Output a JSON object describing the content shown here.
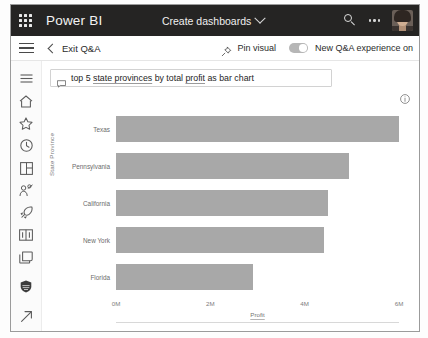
{
  "topbar": {
    "waffle_icon": "app-launcher-icon",
    "brand": "Power BI",
    "title": "Create dashboards",
    "chevron_icon": "chevron-down-icon",
    "search_icon": "search-icon",
    "more_icon": "more-horizontal-icon",
    "avatar_icon": "user-avatar"
  },
  "toolbar": {
    "menu_icon": "hamburger-menu-icon",
    "back_icon": "chevron-left-icon",
    "exit_label": "Exit Q&A",
    "pin_icon": "pin-icon",
    "pin_label": "Pin visual",
    "toggle_state": "on",
    "toggle_label": "New Q&A experience on"
  },
  "sidebar": {
    "items": [
      {
        "name": "sidebar-item-menu",
        "icon": "hamburger-menu-icon"
      },
      {
        "name": "sidebar-item-home",
        "icon": "home-icon"
      },
      {
        "name": "sidebar-item-favorites",
        "icon": "star-icon"
      },
      {
        "name": "sidebar-item-recent",
        "icon": "clock-icon"
      },
      {
        "name": "sidebar-item-apps",
        "icon": "apps-grid-icon"
      },
      {
        "name": "sidebar-item-shared",
        "icon": "shared-with-me-icon"
      },
      {
        "name": "sidebar-item-goals",
        "icon": "rocket-icon"
      },
      {
        "name": "sidebar-item-learn",
        "icon": "book-icon"
      },
      {
        "name": "sidebar-item-workspaces",
        "icon": "workspaces-icon"
      },
      {
        "name": "sidebar-item-deployment",
        "icon": "database-icon"
      },
      {
        "name": "sidebar-item-expand",
        "icon": "arrow-up-right-icon"
      }
    ]
  },
  "query": {
    "icon": "chat-bubble-icon",
    "prefix": "top 5 ",
    "field1": "state provinces",
    "middle": " by total ",
    "field2": "profit",
    "suffix": " as bar chart",
    "full_text": "top 5 state provinces by total profit as bar chart"
  },
  "visual": {
    "info_icon": "info-icon"
  },
  "colors": {
    "topbar_bg": "#252423",
    "bar_fill": "#a8a8a8",
    "axis_text": "#7d7d7d",
    "toggle_bg": "#b6b6b6"
  },
  "chart_data": {
    "type": "bar",
    "orientation": "horizontal",
    "title": "",
    "xlabel": "Profit",
    "ylabel": "State Province",
    "categories": [
      "Texas",
      "Pennsylvania",
      "California",
      "New York",
      "Florida"
    ],
    "values": [
      6.0,
      4.95,
      4.5,
      4.4,
      2.9
    ],
    "value_unit": "M",
    "xticks": [
      "0M",
      "2M",
      "4M",
      "6M"
    ],
    "xtick_values": [
      0,
      2,
      4,
      6
    ],
    "xlim": [
      0,
      6
    ],
    "grid": false,
    "legend": "none",
    "series": [
      {
        "name": "Profit",
        "values": [
          6.0,
          4.95,
          4.5,
          4.4,
          2.9
        ]
      }
    ]
  }
}
